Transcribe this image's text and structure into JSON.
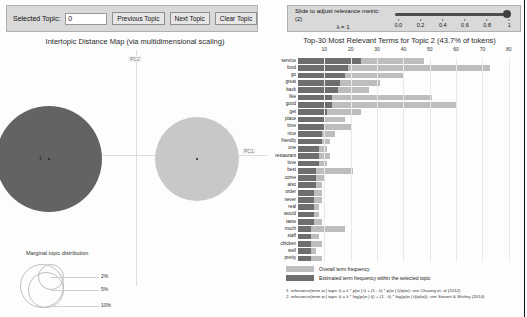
{
  "topic_controls": {
    "selected_topic_label": "Selected Topic:",
    "selected_topic_value": "0",
    "previous_topic_label": "Previous Topic",
    "next_topic_label": "Next Topic",
    "clear_topic_label": "Clear Topic"
  },
  "lambda_controls": {
    "slider_label": "Slide to adjust relevance metric:(2)",
    "lambda_label": "λ = 1",
    "lambda_value": 1,
    "ticks": [
      "0.0",
      "0.2",
      "0.4",
      "0.6",
      "0.8",
      "1"
    ]
  },
  "left_panel": {
    "title": "Intertopic Distance Map (via multidimensional scaling)",
    "pc1_label": "PC1",
    "pc2_label": "PC2",
    "marginal_title": "Marginal topic distribution",
    "marginal_sizes": [
      "2%",
      "5%",
      "10%"
    ],
    "topics": [
      {
        "id": "1",
        "x_pct": 17,
        "y_pct": 46,
        "r_px": 53,
        "color": "#636363",
        "selected": true
      },
      {
        "id": "2",
        "x_pct": 73,
        "y_pct": 46,
        "r_px": 42,
        "color": "#c8c8c8",
        "selected": false
      }
    ]
  },
  "chart_data": {
    "type": "bar",
    "title": "Top-30 Most Relevant Terms for Topic 2 (43.7% of tokens)",
    "topic_number": 2,
    "topic_token_pct": "43.7%",
    "xlabel": "",
    "ylabel": "",
    "xlim": [
      0,
      85
    ],
    "xticks": [
      10,
      20,
      30,
      40,
      50,
      60,
      70,
      80
    ],
    "grid": true,
    "legend_position": "bottom",
    "legend": [
      {
        "label": "Overall term frequency",
        "color": "#bdbdbd"
      },
      {
        "label": "Estimated term frequency within the selected topic",
        "color": "#6e6e6e"
      }
    ],
    "categories": [
      "service",
      "food",
      "go",
      "great",
      "back",
      "like",
      "good",
      "get",
      "place",
      "time",
      "nice",
      "friendly",
      "one",
      "restaurant",
      "love",
      "best",
      "come",
      "also",
      "order",
      "never",
      "real",
      "would",
      "taste",
      "much",
      "staff",
      "chicken",
      "well",
      "pretty"
    ],
    "series": [
      {
        "name": "Overall term frequency",
        "color": "#bdbdbd",
        "values": [
          48,
          73,
          40,
          31,
          27,
          51,
          60,
          24,
          18,
          20,
          14,
          12,
          11,
          12,
          11,
          21,
          10,
          9,
          9,
          9,
          8,
          8,
          9,
          18,
          8,
          9,
          7,
          9
        ]
      },
      {
        "name": "Estimated term frequency within the selected topic",
        "color": "#6e6e6e",
        "values": [
          24,
          19,
          18,
          16,
          15,
          13,
          13,
          11,
          10,
          10,
          9,
          9,
          8,
          8,
          8,
          7,
          7,
          7,
          6,
          6,
          6,
          6,
          6,
          5,
          5,
          5,
          5,
          5
        ]
      }
    ]
  },
  "footnotes": [
    "1. relevance(term w | topic t) = λ * p(w | t) + (1 - λ) * p(w | t)/p(w); see Chuang et. al (2012)",
    "2. relevance(term w | topic t) = λ * log(p(w | t)) + (1 - λ) * log(p(w | t)/p(w)); see Sievert & Shirley (2014)"
  ]
}
